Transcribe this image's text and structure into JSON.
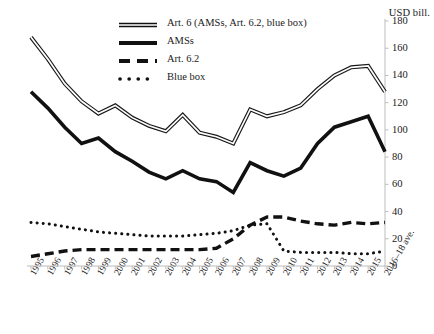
{
  "chart_data": {
    "type": "line",
    "title": "",
    "subtitle": "",
    "xlabel": "",
    "ylabel": "USD bill.",
    "ylim": [
      0,
      180
    ],
    "ytick_step": 20,
    "yticks": [
      180,
      160,
      140,
      120,
      100,
      80,
      60,
      40,
      20,
      0
    ],
    "grid": false,
    "legend_position": "top-center",
    "categories": [
      "1995",
      "1996",
      "1997",
      "1998",
      "1999",
      "2000",
      "2001",
      "2002",
      "2003",
      "2004",
      "2005",
      "2006",
      "2007",
      "2008",
      "2009",
      "2010",
      "2011",
      "2012",
      "2013",
      "2014",
      "2015",
      "2016–18 ave."
    ],
    "series": [
      {
        "name": "Art. 6 (AMSs, Art. 6.2, blue box)",
        "style": "double-solid",
        "color": "#1a1a1a",
        "values": [
          168,
          152,
          134,
          121,
          112,
          118,
          109,
          103,
          99,
          111,
          98,
          95,
          90,
          115,
          110,
          113,
          118,
          130,
          140,
          146,
          147,
          128
        ]
      },
      {
        "name": "AMSs",
        "style": "thick-solid",
        "color": "#111111",
        "values": [
          128,
          116,
          102,
          90,
          94,
          84,
          77,
          69,
          64,
          70,
          64,
          62,
          54,
          76,
          70,
          66,
          72,
          90,
          102,
          106,
          110,
          84
        ]
      },
      {
        "name": "Art. 6.2",
        "style": "dashed",
        "color": "#111111",
        "values": [
          7,
          9,
          11,
          12,
          12,
          12,
          12,
          12,
          12,
          12,
          12,
          13,
          20,
          30,
          36,
          36,
          33,
          31,
          30,
          32,
          31,
          32
        ]
      },
      {
        "name": "Blue box",
        "style": "dotted",
        "color": "#111111",
        "values": [
          32,
          31,
          29,
          27,
          25,
          24,
          23,
          22,
          22,
          22,
          23,
          24,
          26,
          30,
          31,
          11,
          10,
          10,
          10,
          9,
          9,
          11
        ]
      }
    ]
  },
  "legend": {
    "items": [
      {
        "label": "Art. 6 (AMSs, Art. 6.2, blue box)",
        "style": "double-solid"
      },
      {
        "label": "AMSs",
        "style": "thick-solid"
      },
      {
        "label": "Art. 6.2",
        "style": "dashed"
      },
      {
        "label": "Blue box",
        "style": "dotted"
      }
    ]
  },
  "axis": {
    "y_title": "USD bill."
  }
}
